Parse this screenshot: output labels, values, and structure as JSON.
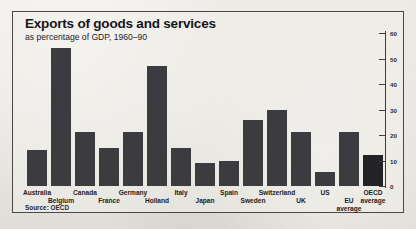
{
  "chart_data": {
    "type": "bar",
    "title": "Exports of goods and services",
    "subtitle": "as percentage of GDP, 1960–90",
    "source": "Source: OECD",
    "xlabel": "",
    "ylabel": "",
    "ylim": [
      0,
      60
    ],
    "yticks": [
      0,
      10,
      20,
      30,
      40,
      50,
      60
    ],
    "ytick_labels": [
      "0",
      "10",
      "20",
      "30",
      "40",
      "50",
      "60"
    ],
    "grid": false,
    "legend": false,
    "axis_position": "right",
    "bar_color": "#3c3b40",
    "categories": [
      "Australia",
      "Belgium",
      "Canada",
      "France",
      "Germany",
      "Holland",
      "Italy",
      "Japan",
      "Spain",
      "Sweden",
      "Switzerland",
      "UK",
      "US",
      "EU average",
      "OECD average"
    ],
    "values": [
      14,
      54,
      21,
      15,
      21,
      47,
      15,
      9,
      10,
      26,
      30,
      21,
      5.5,
      21,
      12
    ]
  },
  "frame": {
    "border_color": "#4a4845",
    "background_color": "#e8e6e1"
  }
}
